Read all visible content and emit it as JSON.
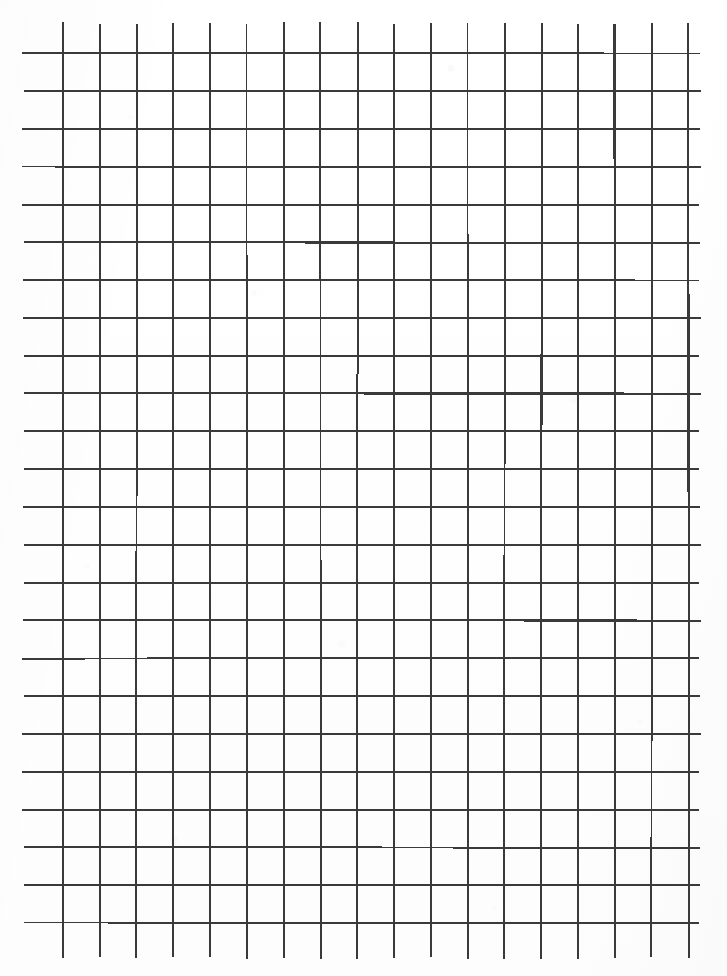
{
  "document": {
    "kind": "scanned-grid-paper",
    "title": "Blank hand-drawn grid sheet",
    "width": 727,
    "height": 976,
    "background_color": "#fefefe",
    "has_text": false,
    "has_handwriting": false,
    "annotations": []
  },
  "grid": {
    "line_color": "#3a3a3a",
    "line_width": 2.0,
    "columns": 18,
    "rows": 24,
    "cell_width": 36.8,
    "cell_height": 37.8,
    "vertical_lines": {
      "count": 18,
      "first_x": 63,
      "spacing": 36.8,
      "y_start": 23,
      "y_end": 958
    },
    "horizontal_lines": {
      "count": 24,
      "first_y": 53.5,
      "spacing": 37.8,
      "x_start": 23,
      "x_end": 700
    },
    "margins": {
      "left": 23,
      "top": 23,
      "right": 27,
      "bottom": 18
    }
  }
}
